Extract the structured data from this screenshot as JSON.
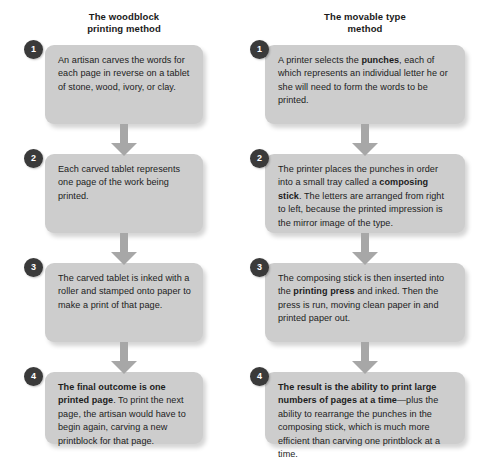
{
  "diagram": {
    "colors": {
      "page_background": "#ffffff",
      "box_fill": "#cdcdcd",
      "badge_fill": "#3a3a3a",
      "badge_text": "#ffffff",
      "arrow_fill": "#a7a7a7",
      "text": "#1c1c1c"
    }
  },
  "columns": [
    {
      "id": "woodblock",
      "header_lines": [
        "The woodblock",
        "printing method"
      ],
      "steps": [
        {
          "number": "1",
          "text_html": "An artisan carves the words for each page in reverse on a tablet of stone, wood, ivory, or clay.",
          "text_plain": "An artisan carves the words for each page in reverse on a tablet of stone, wood, ivory, or clay."
        },
        {
          "number": "2",
          "text_html": "Each carved tablet represents one page of the work being printed.",
          "text_plain": "Each carved tablet represents one page of the work being printed."
        },
        {
          "number": "3",
          "text_html": "The carved tablet is inked with a roller and stamped onto paper to make a print of that page.",
          "text_plain": "The carved tablet is inked with a roller and stamped onto paper to make a print of that page."
        },
        {
          "number": "4",
          "text_html": "<b>The final outcome is one printed page</b>. To print the next page, the artisan would have to begin again, carving a new printblock for that page.",
          "text_plain": "The final outcome is one printed page. To print the next page, the artisan would have to begin again, carving a new printblock for that page."
        }
      ]
    },
    {
      "id": "movable-type",
      "header_lines": [
        "The movable type",
        "method"
      ],
      "steps": [
        {
          "number": "1",
          "text_html": "A printer selects the <b>punches</b>, each of which represents an individual letter he or she will need to form the words to be printed.",
          "text_plain": "A printer selects the punches, each of which represents an individual letter he or she will need to form the words to be printed."
        },
        {
          "number": "2",
          "text_html": "The printer places the punches in order into a small tray called a <b>composing stick</b>. The letters are arranged from right to left, because the printed impression is the mirror image of the type.",
          "text_plain": "The printer places the punches in order into a small tray called a composing stick. The letters are arranged from right to left, because the printed impression is the mirror image of the type."
        },
        {
          "number": "3",
          "text_html": "The composing stick is then inserted into the <b>printing press</b> and inked. Then the press is run, moving clean paper in and printed paper out.",
          "text_plain": "The composing stick is then inserted into the printing press and inked. Then the press is run, moving clean paper in and printed paper out."
        },
        {
          "number": "4",
          "text_html": "<b>The result is the ability to print large numbers of pages at a time</b>&mdash;plus the ability to rearrange the punches in the composing stick, which is much more efficient than carving one printblock at a time.",
          "text_plain": "The result is the ability to print large numbers of pages at a time—plus the ability to rearrange the punches in the composing stick, which is much more efficient than carving one printblock at a time."
        }
      ]
    }
  ]
}
